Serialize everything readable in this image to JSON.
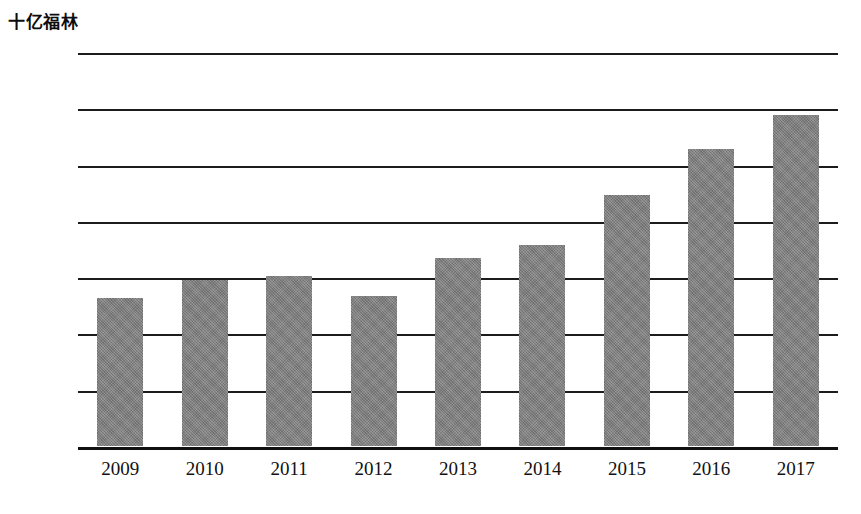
{
  "chart_data": {
    "type": "bar",
    "title": "十亿福林",
    "xlabel": "",
    "ylabel": "十亿福林",
    "categories": [
      "2009",
      "2010",
      "2011",
      "2012",
      "2013",
      "2014",
      "2015",
      "2016",
      "2017"
    ],
    "values": [
      263,
      295,
      302,
      266,
      334,
      357,
      446,
      528,
      588
    ],
    "ylim": [
      0,
      700
    ],
    "yticks": [
      0,
      100,
      200,
      300,
      400,
      500,
      600,
      700
    ],
    "ytick_labels": [
      "0",
      "100",
      "200",
      "300",
      "400",
      "500",
      "600",
      "700"
    ],
    "grid": true,
    "legend": false,
    "legend_position": "none",
    "series": [
      {
        "name": "十亿福林",
        "values": [
          263,
          295,
          302,
          266,
          334,
          357,
          446,
          528,
          588
        ]
      }
    ],
    "colors": {
      "bar_fill": "#808080",
      "gridline": "#1c1c1c",
      "text": "#111111",
      "background": "#ffffff"
    }
  }
}
